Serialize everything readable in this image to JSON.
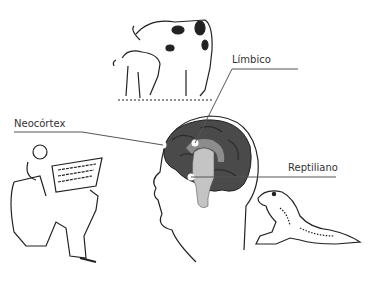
{
  "diagram": {
    "labels": {
      "limbic": "Límbico",
      "neocortex": "Neocórtex",
      "reptilian": "Reptiliano"
    },
    "illustrations": [
      "cow-and-calf",
      "man-reading-newspaper",
      "human-head-brain",
      "lizard"
    ],
    "colors": {
      "neocortex": "#4a4a4a",
      "limbic": "#8c8c8c",
      "reptilian": "#c4c4c4",
      "line": "#555555",
      "marker": "#ffffff"
    }
  }
}
